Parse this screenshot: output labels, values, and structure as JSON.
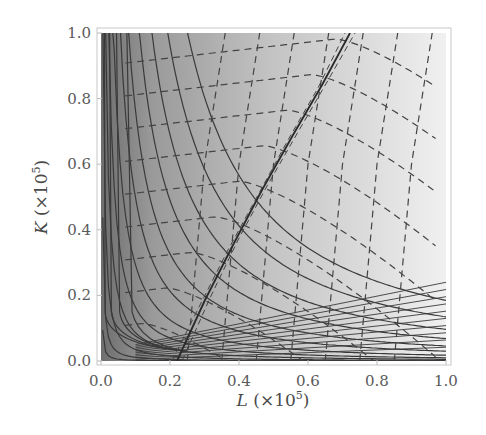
{
  "chart_data": {
    "type": "heatmap",
    "subtype": "contour",
    "title": "",
    "xlabel": "L (×10^5)",
    "ylabel": "K (×10^5)",
    "xlabel_parts": {
      "var": "L",
      "rest": " (×10",
      "exp": "5",
      "close": ")"
    },
    "ylabel_parts": {
      "var": "K",
      "rest": " (×10",
      "exp": "5",
      "close": ")"
    },
    "xlim": [
      0.0,
      1.0
    ],
    "ylim": [
      0.0,
      1.0
    ],
    "x_ticks": [
      "0.0",
      "0.2",
      "0.4",
      "0.6",
      "0.8",
      "1.0"
    ],
    "y_ticks": [
      "0.0",
      "0.2",
      "0.4",
      "0.6",
      "0.8",
      "1.0"
    ],
    "grid": false,
    "legend": null,
    "shading": "grayscale, dark near L=0 and near K=0 at large L, lightest at top-right",
    "series": [
      {
        "name": "solid contours",
        "style": "solid",
        "description": "level curves convex to origin; vertical near L≈0, flatten toward horizontal for large L",
        "count_approx": 20
      },
      {
        "name": "dashed contours",
        "style": "dashed",
        "description": "second family of level curves, near-horizontal on left side, near-vertical on right side",
        "count_approx": 18
      },
      {
        "name": "ridge line",
        "style": "solid-jagged",
        "description": "diagonal line from about (0.22,0.0) to (0.75,1.0)"
      }
    ]
  }
}
